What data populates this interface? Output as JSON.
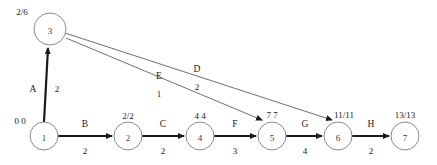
{
  "diagram": {
    "type": "project-network-pert-cpm",
    "nodes": [
      {
        "id": "1",
        "label": "1",
        "time_label": "0 0",
        "early": "0",
        "late": "0",
        "cx": 44,
        "cy": 136,
        "r": 14,
        "time_x": 20,
        "time_y": 124
      },
      {
        "id": "2",
        "label": "2",
        "time_label": "2/2",
        "early": "2",
        "late": "2",
        "cx": 128,
        "cy": 136,
        "r": 14,
        "time_x": 128,
        "time_y": 119
      },
      {
        "id": "3",
        "label": "3",
        "time_label": "2/6",
        "early": "2",
        "late": "6",
        "cx": 50,
        "cy": 29,
        "r": 16,
        "time_x": 22,
        "time_y": 15
      },
      {
        "id": "4",
        "label": "4",
        "time_label": "4 4",
        "early": "4",
        "late": "4",
        "cx": 200,
        "cy": 136,
        "r": 14,
        "time_x": 200,
        "time_y": 119
      },
      {
        "id": "5",
        "label": "5",
        "time_label": "7 7",
        "early": "7",
        "late": "7",
        "cx": 272,
        "cy": 136,
        "r": 14,
        "time_x": 272,
        "time_y": 118
      },
      {
        "id": "6",
        "label": "6",
        "time_label": "11/11",
        "early": "11",
        "late": "11",
        "cx": 338,
        "cy": 136,
        "r": 14,
        "time_x": 344,
        "time_y": 118
      },
      {
        "id": "7",
        "label": "7",
        "time_label": "13/13",
        "early": "13",
        "late": "13",
        "cx": 405,
        "cy": 136,
        "r": 14,
        "time_x": 405,
        "time_y": 118
      }
    ],
    "edges": [
      {
        "name": "A",
        "weight": "2",
        "from": "1",
        "to": "3",
        "style": "thick",
        "x1": 44,
        "y1": 122,
        "x2": 48,
        "y2": 48,
        "name_x": 33,
        "name_y": 92,
        "weight_x": 57,
        "weight_y": 92
      },
      {
        "name": "B",
        "weight": "2",
        "from": "1",
        "to": "2",
        "style": "thick",
        "x1": 58,
        "y1": 136,
        "x2": 112,
        "y2": 136,
        "name_x": 85,
        "name_y": 127,
        "weight_x": 85,
        "weight_y": 154
      },
      {
        "name": "C",
        "weight": "2",
        "from": "2",
        "to": "4",
        "style": "thick",
        "x1": 142,
        "y1": 136,
        "x2": 184,
        "y2": 136,
        "name_x": 163,
        "name_y": 127,
        "weight_x": 163,
        "weight_y": 154
      },
      {
        "name": "D",
        "weight": "2",
        "from": "3",
        "to": "6",
        "style": "thin",
        "x1": 65,
        "y1": 33,
        "x2": 332,
        "y2": 120,
        "name_x": 197,
        "name_y": 72,
        "weight_x": 197,
        "weight_y": 90
      },
      {
        "name": "E",
        "weight": "1",
        "from": "3",
        "to": "5",
        "style": "thin",
        "x1": 66,
        "y1": 38,
        "x2": 262,
        "y2": 120,
        "name_x": 159,
        "name_y": 79,
        "weight_x": 159,
        "weight_y": 97
      },
      {
        "name": "F",
        "weight": "3",
        "from": "4",
        "to": "5",
        "style": "thick",
        "x1": 214,
        "y1": 136,
        "x2": 256,
        "y2": 136,
        "name_x": 235,
        "name_y": 127,
        "weight_x": 235,
        "weight_y": 154
      },
      {
        "name": "G",
        "weight": "4",
        "from": "5",
        "to": "6",
        "style": "thick",
        "x1": 286,
        "y1": 136,
        "x2": 322,
        "y2": 136,
        "name_x": 305,
        "name_y": 127,
        "weight_x": 305,
        "weight_y": 154
      },
      {
        "name": "H",
        "weight": "2",
        "from": "6",
        "to": "7",
        "style": "thick",
        "x1": 352,
        "y1": 136,
        "x2": 389,
        "y2": 136,
        "name_x": 371,
        "name_y": 127,
        "weight_x": 371,
        "weight_y": 154
      }
    ],
    "colors": {
      "critical_path_line": "#1a1a1a",
      "secondary_line": "#4a4a4a",
      "node_stroke": "#8a8a8a",
      "background": "#ffffff"
    }
  }
}
